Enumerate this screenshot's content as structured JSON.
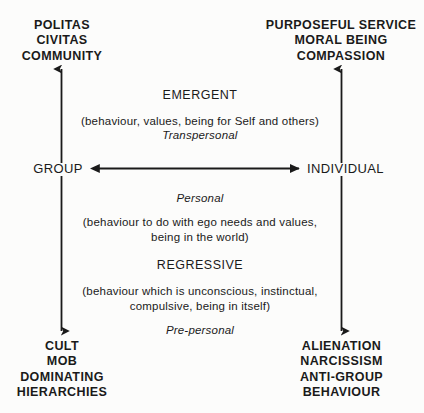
{
  "diagram": {
    "background_color": "#fcfcfb",
    "ink_color": "#1a1a1a",
    "corners": {
      "top_left": {
        "lines": [
          "POLITAS",
          "CIVITAS",
          "COMMUNITY"
        ]
      },
      "top_right": {
        "lines": [
          "PURPOSEFUL SERVICE",
          "MORAL BEING",
          "COMPASSION"
        ]
      },
      "bottom_left": {
        "lines": [
          "CULT",
          "MOB",
          "DOMINATING",
          "HIERARCHIES"
        ]
      },
      "bottom_right": {
        "lines": [
          "ALIENATION",
          "NARCISSISM",
          "ANTI-GROUP",
          "BEHAVIOUR"
        ]
      }
    },
    "axis": {
      "left_label": "GROUP",
      "right_label": "INDIVIDUAL"
    },
    "bands": {
      "emergent": {
        "heading": "EMERGENT",
        "description_lines": [
          "(behaviour, values, being for Self and others)"
        ],
        "level": "Transpersonal"
      },
      "personal": {
        "level": "Personal",
        "description_lines": [
          "(behaviour to do with ego needs and values,",
          "being in the world)"
        ]
      },
      "regressive": {
        "heading": "REGRESSIVE",
        "description_lines": [
          "(behaviour which is unconscious, instinctual,",
          "compulsive, being in itself)"
        ],
        "level": "Pre-personal"
      }
    },
    "icons": {
      "arrow_up_left": "arrow-up-icon",
      "arrow_up_right": "arrow-up-icon",
      "arrow_down_left": "arrow-down-icon",
      "arrow_down_right": "arrow-down-icon",
      "arrow_horizontal": "arrow-left-right-icon"
    }
  }
}
